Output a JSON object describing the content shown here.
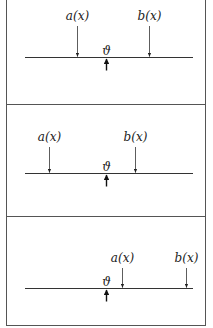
{
  "figure": {
    "frame": {
      "x": 6,
      "y": -1,
      "width": 199,
      "height": 326,
      "stroke": "#555555"
    },
    "dividers": [
      104,
      216
    ],
    "panels": [
      {
        "id": "panel-1",
        "axis": {
          "y": 57,
          "x1": 25,
          "x2": 193
        },
        "markers": [
          {
            "name": "a",
            "label": "a(x)",
            "x": 77,
            "label_y": 20
          },
          {
            "name": "b",
            "label": "b(x)",
            "x": 149,
            "label_y": 20
          }
        ],
        "theta": {
          "label": "ϑ",
          "x": 106
        }
      },
      {
        "id": "panel-2",
        "axis": {
          "y": 173,
          "x1": 25,
          "x2": 193
        },
        "markers": [
          {
            "name": "a",
            "label": "a(x)",
            "x": 49,
            "label_y": 141
          },
          {
            "name": "b",
            "label": "b(x)",
            "x": 135,
            "label_y": 141
          }
        ],
        "theta": {
          "label": "ϑ",
          "x": 106
        }
      },
      {
        "id": "panel-3",
        "axis": {
          "y": 288,
          "x1": 25,
          "x2": 193
        },
        "markers": [
          {
            "name": "a",
            "label": "a(x)",
            "x": 122,
            "label_y": 262
          },
          {
            "name": "b",
            "label": "b(x)",
            "x": 186,
            "label_y": 262
          }
        ],
        "theta": {
          "label": "ϑ",
          "x": 106
        }
      }
    ]
  }
}
